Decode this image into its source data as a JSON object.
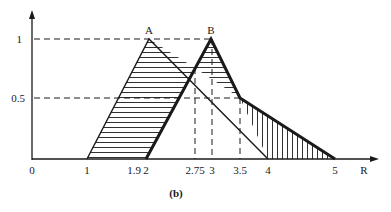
{
  "figure": {
    "caption": "(b)",
    "x_axis_label": "R",
    "x_ticks": [
      {
        "label": "0",
        "value": 0,
        "px": 32
      },
      {
        "label": "1",
        "value": 1,
        "px": 87
      },
      {
        "label": "1.9",
        "value": 1.9,
        "px": 135
      },
      {
        "label": "2",
        "value": 2,
        "px": 146
      },
      {
        "label": "2.75",
        "value": 2.75,
        "px": 195
      },
      {
        "label": "3",
        "value": 3,
        "px": 212
      },
      {
        "label": "3.5",
        "value": 3.5,
        "px": 240
      },
      {
        "label": "4",
        "value": 4,
        "px": 268
      },
      {
        "label": "5",
        "value": 5,
        "px": 335
      }
    ],
    "y_ticks": [
      {
        "label": "1",
        "value": 1,
        "px": 39
      },
      {
        "label": "0.5",
        "value": 0.5,
        "px": 98
      }
    ],
    "peaks": [
      {
        "label": "A",
        "x": 2.2,
        "y": 1
      },
      {
        "label": "B",
        "x": 3,
        "y": 1
      }
    ],
    "shapes": {
      "triangle_A": {
        "left": 1,
        "peak": 2.2,
        "right": 4,
        "hatch": "horizontal"
      },
      "triangle_B": {
        "left": 2,
        "peak": 3,
        "right": 3.5,
        "style": "thick"
      },
      "tail": {
        "from": 3.5,
        "to": 5,
        "hatch": "vertical"
      }
    },
    "colors": {
      "ink": "#1a1a1a",
      "background": "#ffffff"
    }
  }
}
